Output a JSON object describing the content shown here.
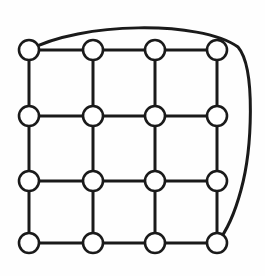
{
  "diagram": {
    "type": "node-link-diagram",
    "canvas": {
      "width": 265,
      "height": 276,
      "background": "#fefefe"
    },
    "style": {
      "node_fill": "#ffffff",
      "node_stroke": "#1a1a1a",
      "node_stroke_width": 2.6,
      "node_radius": 10,
      "edge_color": "#1a1a1a",
      "edge_width": 3,
      "arc_color": "#1a1a1a",
      "arc_width": 3
    },
    "grid": {
      "rows": 4,
      "columns": 4,
      "column_x": [
        29,
        93,
        155,
        217
      ],
      "row_y": [
        50,
        116,
        181,
        243
      ]
    },
    "nodes": [
      {
        "id": "n00",
        "label": "",
        "row": 0,
        "col": 0,
        "cx": 29,
        "cy": 50
      },
      {
        "id": "n01",
        "label": "",
        "row": 0,
        "col": 1,
        "cx": 93,
        "cy": 50
      },
      {
        "id": "n02",
        "label": "",
        "row": 0,
        "col": 2,
        "cx": 155,
        "cy": 50
      },
      {
        "id": "n03",
        "label": "",
        "row": 0,
        "col": 3,
        "cx": 217,
        "cy": 50
      },
      {
        "id": "n10",
        "label": "",
        "row": 1,
        "col": 0,
        "cx": 29,
        "cy": 116
      },
      {
        "id": "n11",
        "label": "",
        "row": 1,
        "col": 1,
        "cx": 93,
        "cy": 116
      },
      {
        "id": "n12",
        "label": "",
        "row": 1,
        "col": 2,
        "cx": 155,
        "cy": 116
      },
      {
        "id": "n13",
        "label": "",
        "row": 1,
        "col": 3,
        "cx": 217,
        "cy": 116
      },
      {
        "id": "n20",
        "label": "",
        "row": 2,
        "col": 0,
        "cx": 29,
        "cy": 181
      },
      {
        "id": "n21",
        "label": "",
        "row": 2,
        "col": 1,
        "cx": 93,
        "cy": 181
      },
      {
        "id": "n22",
        "label": "",
        "row": 2,
        "col": 2,
        "cx": 155,
        "cy": 181
      },
      {
        "id": "n23",
        "label": "",
        "row": 2,
        "col": 3,
        "cx": 217,
        "cy": 181
      },
      {
        "id": "n30",
        "label": "",
        "row": 3,
        "col": 0,
        "cx": 29,
        "cy": 243
      },
      {
        "id": "n31",
        "label": "",
        "row": 3,
        "col": 1,
        "cx": 93,
        "cy": 243
      },
      {
        "id": "n32",
        "label": "",
        "row": 3,
        "col": 2,
        "cx": 155,
        "cy": 243
      },
      {
        "id": "n33",
        "label": "",
        "row": 3,
        "col": 3,
        "cx": 217,
        "cy": 243
      }
    ],
    "edges": [
      {
        "from": "n00",
        "to": "n01",
        "kind": "horizontal"
      },
      {
        "from": "n01",
        "to": "n02",
        "kind": "horizontal"
      },
      {
        "from": "n02",
        "to": "n03",
        "kind": "horizontal"
      },
      {
        "from": "n10",
        "to": "n11",
        "kind": "horizontal"
      },
      {
        "from": "n11",
        "to": "n12",
        "kind": "horizontal"
      },
      {
        "from": "n12",
        "to": "n13",
        "kind": "horizontal"
      },
      {
        "from": "n20",
        "to": "n21",
        "kind": "horizontal"
      },
      {
        "from": "n21",
        "to": "n22",
        "kind": "horizontal"
      },
      {
        "from": "n22",
        "to": "n23",
        "kind": "horizontal"
      },
      {
        "from": "n30",
        "to": "n31",
        "kind": "horizontal"
      },
      {
        "from": "n31",
        "to": "n32",
        "kind": "horizontal"
      },
      {
        "from": "n32",
        "to": "n33",
        "kind": "horizontal"
      },
      {
        "from": "n00",
        "to": "n10",
        "kind": "vertical"
      },
      {
        "from": "n10",
        "to": "n20",
        "kind": "vertical"
      },
      {
        "from": "n20",
        "to": "n30",
        "kind": "vertical"
      },
      {
        "from": "n01",
        "to": "n11",
        "kind": "vertical"
      },
      {
        "from": "n11",
        "to": "n21",
        "kind": "vertical"
      },
      {
        "from": "n21",
        "to": "n31",
        "kind": "vertical"
      },
      {
        "from": "n02",
        "to": "n12",
        "kind": "vertical"
      },
      {
        "from": "n12",
        "to": "n22",
        "kind": "vertical"
      },
      {
        "from": "n22",
        "to": "n32",
        "kind": "vertical"
      },
      {
        "from": "n03",
        "to": "n13",
        "kind": "vertical"
      },
      {
        "from": "n13",
        "to": "n23",
        "kind": "vertical"
      },
      {
        "from": "n23",
        "to": "n33",
        "kind": "vertical"
      }
    ],
    "arc": {
      "from": "n00",
      "to": "n33",
      "kind": "curved",
      "path": "M 29 50 C 80 22, 200 20, 238 47 C 256 68, 252 150, 241 190 C 234 216, 226 232, 217 243"
    }
  }
}
